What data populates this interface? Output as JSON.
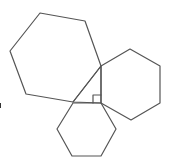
{
  "diagram": {
    "title": "",
    "stroke_color": "#555555",
    "background": "#ffffff",
    "triangle": {
      "points": [
        [
          73,
          102
        ],
        [
          101,
          66
        ],
        [
          101,
          103
        ]
      ],
      "right_angle_vertex": [
        101,
        103
      ]
    },
    "right_angle_marker": {
      "points": [
        [
          93,
          103
        ],
        [
          93,
          95
        ],
        [
          101,
          95
        ]
      ]
    },
    "hexagons": [
      {
        "name": "hypotenuse-hexagon",
        "points": [
          [
            40,
            13
          ],
          [
            85,
            21
          ],
          [
            101,
            66
          ],
          [
            73,
            102
          ],
          [
            26,
            94
          ],
          [
            10,
            51
          ]
        ]
      },
      {
        "name": "vertical-leg-hexagon",
        "points": [
          [
            101,
            66
          ],
          [
            130,
            49
          ],
          [
            160,
            66
          ],
          [
            160,
            103
          ],
          [
            131,
            120
          ],
          [
            101,
            103
          ]
        ]
      },
      {
        "name": "horizontal-leg-hexagon",
        "points": [
          [
            73,
            103
          ],
          [
            101,
            103
          ],
          [
            116,
            129
          ],
          [
            101,
            156
          ],
          [
            72,
            156
          ],
          [
            57,
            129
          ]
        ]
      }
    ],
    "edge_fragment_color": "#333333"
  }
}
